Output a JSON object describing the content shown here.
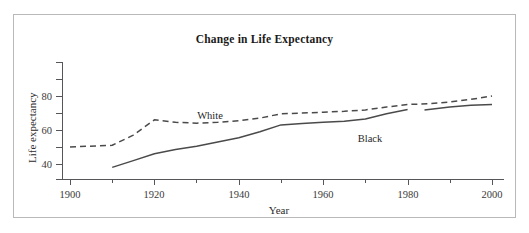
{
  "chart_data": {
    "type": "line",
    "title": "Change in Life Expectancy",
    "xlabel": "Year",
    "ylabel": "Life expectancy",
    "xlim": [
      1900,
      2000
    ],
    "ylim": [
      38,
      90
    ],
    "grid": false,
    "legend": "inline-labels",
    "x_ticks": [
      "1900",
      "1920",
      "1940",
      "1960",
      "1980",
      "2000"
    ],
    "x_tick_values": [
      1900,
      1920,
      1940,
      1960,
      1980,
      2000
    ],
    "x_minor_step": 10,
    "y_ticks": [
      "40",
      "60",
      "80"
    ],
    "y_tick_values": [
      40,
      60,
      80
    ],
    "y_minor_ticks": [
      50,
      70,
      90
    ],
    "series": [
      {
        "name": "White",
        "style": "dashed",
        "color": "#4a4a4a",
        "label_text": "White",
        "x": [
          1900,
          1910,
          1915,
          1920,
          1925,
          1930,
          1935,
          1940,
          1945,
          1950,
          1955,
          1960,
          1965,
          1970,
          1975,
          1980,
          1985,
          1990,
          1995,
          2000
        ],
        "values": [
          50.0,
          51.0,
          57.0,
          66.0,
          64.5,
          64.0,
          64.5,
          65.5,
          67.0,
          69.5,
          70.0,
          70.5,
          71.0,
          71.8,
          73.5,
          75.0,
          75.5,
          76.5,
          78.0,
          80.0
        ]
      },
      {
        "name": "Black",
        "style": "solid",
        "color": "#4a4a4a",
        "label_text": "Black",
        "x": [
          1910,
          1915,
          1920,
          1925,
          1930,
          1935,
          1940,
          1945,
          1950,
          1955,
          1960,
          1965,
          1970,
          1975,
          1980
        ],
        "values": [
          38.0,
          42.0,
          46.0,
          48.5,
          50.5,
          53.0,
          55.5,
          59.0,
          63.0,
          63.8,
          64.5,
          65.2,
          66.5,
          69.5,
          72.0
        ],
        "segment_2_x": [
          1984,
          1990,
          1995,
          2000
        ],
        "segment_2_values": [
          71.8,
          73.5,
          74.5,
          75.0
        ],
        "note": "line has a visible break between 1980 and 1984"
      }
    ]
  },
  "figure": {
    "border_color": "#b9b9b9",
    "background": "#ffffff",
    "axis_color": "#55555a"
  }
}
